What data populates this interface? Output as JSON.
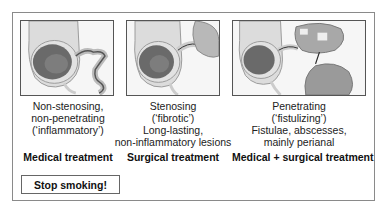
{
  "panels": [
    {
      "illustration": "colon-inflammatory-illustration",
      "caption": [
        "Non-stenosing,",
        "non-penetrating",
        "(‘inflammatory’)"
      ],
      "treatment": "Medical treatment"
    },
    {
      "illustration": "colon-stenosing-illustration",
      "caption": [
        "Stenosing",
        "(‘fibrotic’)",
        "Long-lasting,",
        "non-inflammatory lesions"
      ],
      "treatment": "Surgical treatment"
    },
    {
      "illustration": "colon-penetrating-illustration",
      "caption": [
        "Penetrating",
        "(‘fistulizing’)",
        "Fistulae, abscesses,",
        "mainly perianal"
      ],
      "treatment": "Medical + surgical treatment"
    }
  ],
  "advice": "Stop smoking!",
  "colors": {
    "frame": "#8a8a8a",
    "panel_border": "#555555",
    "mucosa": "#6a6a6a",
    "wall": "#d8d8d8"
  }
}
